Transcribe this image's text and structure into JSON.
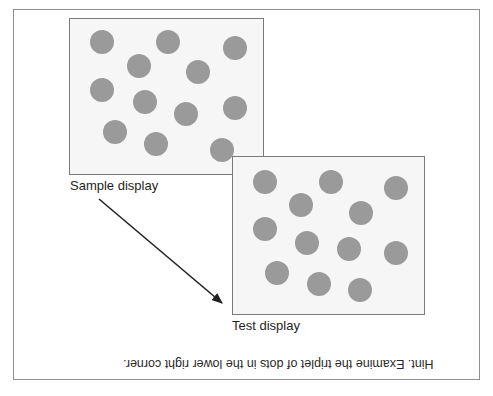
{
  "figure": {
    "sample": {
      "label": "Sample display",
      "box": {
        "left": 69,
        "top": 18,
        "width": 195,
        "height": 157
      },
      "dots": [
        {
          "x": 102,
          "y": 42
        },
        {
          "x": 168,
          "y": 42
        },
        {
          "x": 235,
          "y": 48
        },
        {
          "x": 139,
          "y": 66
        },
        {
          "x": 198,
          "y": 72
        },
        {
          "x": 102,
          "y": 90
        },
        {
          "x": 145,
          "y": 102
        },
        {
          "x": 186,
          "y": 114
        },
        {
          "x": 235,
          "y": 108
        },
        {
          "x": 115,
          "y": 132
        },
        {
          "x": 156,
          "y": 144
        },
        {
          "x": 222,
          "y": 150
        }
      ]
    },
    "test": {
      "label": "Test display",
      "box": {
        "left": 232,
        "top": 156,
        "width": 193,
        "height": 159
      },
      "dots": [
        {
          "x": 265,
          "y": 182
        },
        {
          "x": 331,
          "y": 182
        },
        {
          "x": 396,
          "y": 188
        },
        {
          "x": 301,
          "y": 205
        },
        {
          "x": 361,
          "y": 213
        },
        {
          "x": 265,
          "y": 229
        },
        {
          "x": 307,
          "y": 243
        },
        {
          "x": 349,
          "y": 249
        },
        {
          "x": 396,
          "y": 253
        },
        {
          "x": 277,
          "y": 273
        },
        {
          "x": 319,
          "y": 284
        },
        {
          "x": 360,
          "y": 290
        }
      ]
    },
    "arrow": {
      "x1": 99,
      "y1": 199,
      "x2": 222,
      "y2": 303
    },
    "hint": "Hint. Examine the triplet of dots in the lower right corner.",
    "colors": {
      "dot": "#9a9a9a",
      "panel_bg": "#f6f6f6",
      "panel_border": "#7a7a7a",
      "frame_border": "#8f8f8f",
      "arrow": "#222222"
    }
  }
}
